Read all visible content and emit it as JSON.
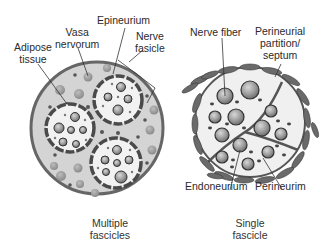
{
  "diagram": {
    "left_panel": {
      "caption_line1": "Multiple",
      "caption_line2": "fascicles",
      "labels": {
        "adipose_line1": "Adipose",
        "adipose_line2": "tissue",
        "vasa_line1": "Vasa",
        "vasa_line2": "nervorum",
        "epineurium": "Epineurium",
        "nerve_fasicle_line1": "Nerve",
        "nerve_fasicle_line2": "fasicle"
      }
    },
    "right_panel": {
      "caption_line1": "Single",
      "caption_line2": "fascicle",
      "labels": {
        "nerve_fiber": "Nerve fiber",
        "septum_line1": "Perineurial",
        "septum_line2": "partition/",
        "septum_line3": "septum",
        "endoneurium": "Endoneurium",
        "perineurium": "Perineurim"
      }
    },
    "colors": {
      "outer_fill": "#d6d6d6",
      "outer_stroke": "#6a6a6a",
      "fascicle_fill": "#f2f2f2",
      "perineurium": "#555555",
      "fiber_fill": "#9a9a9a",
      "dot": "#666666"
    }
  }
}
